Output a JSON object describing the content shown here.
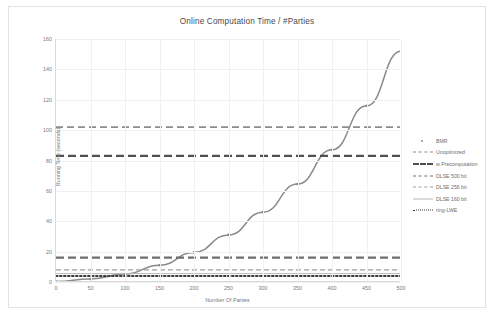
{
  "chart_data": {
    "type": "line",
    "title": "Online Computation Time / #Parties",
    "xlabel": "Number Of Parties",
    "ylabel": "Running Time (seconds)",
    "xlim": [
      0,
      500
    ],
    "ylim": [
      0,
      160
    ],
    "xticks": [
      0,
      50,
      100,
      150,
      200,
      250,
      300,
      350,
      400,
      450,
      500
    ],
    "yticks": [
      0,
      20,
      40,
      60,
      80,
      100,
      120,
      140,
      160
    ],
    "grid": true,
    "legend_position": "right",
    "series": [
      {
        "name": "BMR",
        "style": "marker",
        "color": "#8a8a8a",
        "x": [
          0,
          50,
          100,
          150,
          200,
          250,
          300,
          350,
          400,
          450,
          500
        ],
        "values": [
          0.3,
          2.0,
          5.2,
          11.0,
          19.5,
          31.0,
          46.0,
          64.5,
          87.0,
          116.0,
          152.0
        ]
      },
      {
        "name": "Unoptimized",
        "style": "dashed-medium",
        "color": "#8c8c8c",
        "constant": 102.0
      },
      {
        "name": "w Precomputation",
        "style": "dashed-thick",
        "color": "#4f4f4f",
        "constant": 83.0
      },
      {
        "name": "DLSE 500 bit",
        "style": "dashed-thick",
        "color": "#6e6e6e",
        "constant": 16.0
      },
      {
        "name": "DLSE 256 bit",
        "style": "dash-dot",
        "color": "#9e9e9e",
        "constant": 8.0
      },
      {
        "name": "DLSE 160 bit",
        "style": "solid-thin",
        "color": "#b5b5b5",
        "constant": 5.5
      },
      {
        "name": "ring-LWE",
        "style": "dotted",
        "color": "#3d3d3d",
        "constant": 4.0
      }
    ]
  },
  "legend": {
    "items": [
      {
        "label": "BMR",
        "key": "marker"
      },
      {
        "label": "Unoptimized",
        "key": "dash-med"
      },
      {
        "label": "w Precomputation",
        "key": "dash-thick"
      },
      {
        "label": "DLSE 500 bit",
        "key": "dash-thick2"
      },
      {
        "label": "DLSE 256 bit",
        "key": "dashdot"
      },
      {
        "label": "DLSE 160 bit",
        "key": "solid-thin"
      },
      {
        "label": "ring-LWE",
        "key": "dotted"
      }
    ]
  }
}
